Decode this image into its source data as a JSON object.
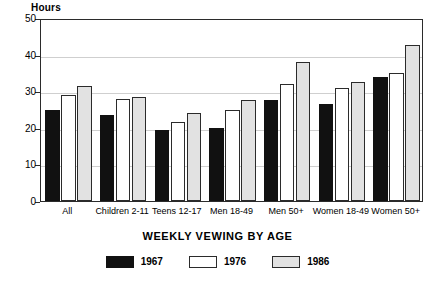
{
  "chart_data": {
    "type": "bar",
    "title": "",
    "xlabel": "WEEKLY VEWING BY AGE",
    "ylabel": "Hours",
    "ylim": [
      0,
      50
    ],
    "yticks": [
      0,
      10,
      20,
      30,
      40,
      50
    ],
    "gridlines": [
      10,
      20,
      30,
      40
    ],
    "grid": true,
    "legend_position": "bottom-center",
    "categories": [
      "All",
      "Children 2-11",
      "Teens 12-17",
      "Men 18-49",
      "Men 50+",
      "Women 18-49",
      "Women 50+"
    ],
    "series": [
      {
        "name": "1967",
        "color": "#111111",
        "values": [
          25.0,
          23.5,
          19.5,
          20.0,
          27.5,
          26.5,
          34.0
        ]
      },
      {
        "name": "1976",
        "color": "#ffffff",
        "values": [
          29.0,
          28.0,
          21.5,
          25.0,
          32.0,
          31.0,
          35.0
        ]
      },
      {
        "name": "1986",
        "color": "#e2e2e2",
        "values": [
          31.5,
          28.5,
          24.0,
          27.5,
          38.0,
          32.5,
          42.5
        ]
      }
    ]
  },
  "legend": {
    "items": [
      {
        "label": "1967",
        "swatch": "black-filled-swatch"
      },
      {
        "label": "1976",
        "swatch": "white-filled-swatch"
      },
      {
        "label": "1986",
        "swatch": "gray-filled-swatch"
      }
    ]
  }
}
